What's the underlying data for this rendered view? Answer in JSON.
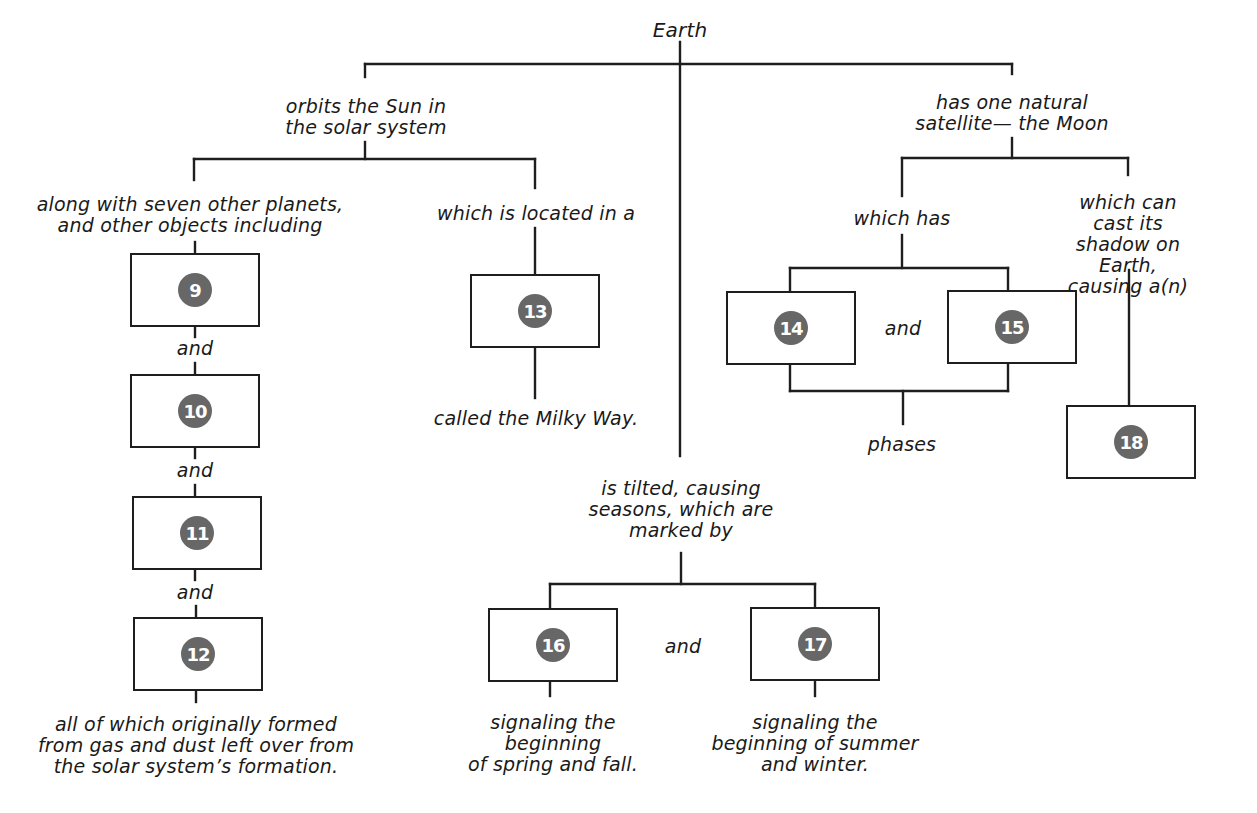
{
  "diagram": {
    "root": "Earth",
    "badge_color": "#676767",
    "line_color": "#1e1e1e",
    "labels": {
      "orbits": "orbits the Sun in\nthe solar system",
      "along_with": "along with seven other planets,\nand other objects including",
      "located": "which is located in a",
      "milky_way": "called the Milky Way.",
      "satellite": "has one natural\nsatellite— the Moon",
      "which_has": "which has",
      "cast_shadow": "which can cast its\nshadow on Earth,\ncausing a(n)",
      "phases": "phases",
      "tilted": "is tilted, causing\nseasons, which are\nmarked by",
      "spring_fall": "signaling the\nbeginning\nof spring and fall.",
      "summer_winter": "signaling the\nbeginning of summer\nand winter.",
      "formed": "all of which originally formed\nfrom gas and dust left over from\nthe solar system’s formation.",
      "and_9_10": "and",
      "and_10_11": "and",
      "and_11_12": "and",
      "and_14_15": "and",
      "and_16_17": "and"
    },
    "boxes": [
      {
        "number": "9"
      },
      {
        "number": "10"
      },
      {
        "number": "11"
      },
      {
        "number": "12"
      },
      {
        "number": "13"
      },
      {
        "number": "14"
      },
      {
        "number": "15"
      },
      {
        "number": "16"
      },
      {
        "number": "17"
      },
      {
        "number": "18"
      }
    ]
  }
}
